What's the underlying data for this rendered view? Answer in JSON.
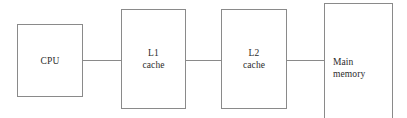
{
  "canvas": {
    "width": 407,
    "height": 118,
    "background": "#ffffff",
    "line_color": "#8a8a8a",
    "text_color": "#2b2b2b"
  },
  "diagram": {
    "type": "block-diagram",
    "title": "",
    "nodes": [
      {
        "id": "cpu",
        "label": "CPU"
      },
      {
        "id": "l1",
        "label": "L1\ncache"
      },
      {
        "id": "l2",
        "label": "L2\ncache"
      },
      {
        "id": "main",
        "label": "Main\nmemory"
      }
    ],
    "connectors": [
      {
        "id": "cpu-l1",
        "from": "cpu",
        "to": "l1",
        "style": "plain-line"
      },
      {
        "id": "l1-l2",
        "from": "l1",
        "to": "l2",
        "style": "plain-line"
      },
      {
        "id": "l2-main",
        "from": "l2",
        "to": "main",
        "style": "plain-line"
      }
    ]
  }
}
